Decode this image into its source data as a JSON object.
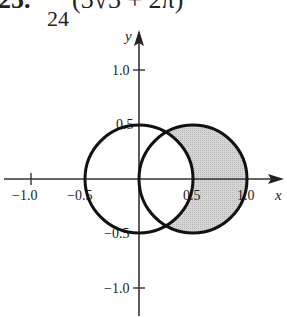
{
  "header": {
    "number": "25.",
    "fraction_numerator": "1",
    "fraction_denominator": "24",
    "expression": "(3√3 + 2π)"
  },
  "axes": {
    "x_label": "x",
    "y_label": "y",
    "x_ticks": [
      {
        "value": -1.0,
        "label": "−1.0"
      },
      {
        "value": -0.5,
        "label": "−0.5"
      },
      {
        "value": 0.5,
        "label": "0.5"
      },
      {
        "value": 1.0,
        "label": "1.0"
      }
    ],
    "y_ticks": [
      {
        "value": 1.0,
        "label": "1.0"
      },
      {
        "value": 0.5,
        "label": "0.5"
      },
      {
        "value": -0.5,
        "label": "−0.5"
      },
      {
        "value": -1.0,
        "label": "−1.0"
      }
    ]
  },
  "shapes": {
    "circle_left": {
      "center": [
        0,
        0
      ],
      "radius": 0.5
    },
    "circle_right": {
      "center": [
        0.5,
        0
      ],
      "radius": 0.5
    },
    "shaded_region": "inside right circle, outside left circle",
    "fill_color": "#cccccc",
    "stroke_color": "#111111"
  }
}
